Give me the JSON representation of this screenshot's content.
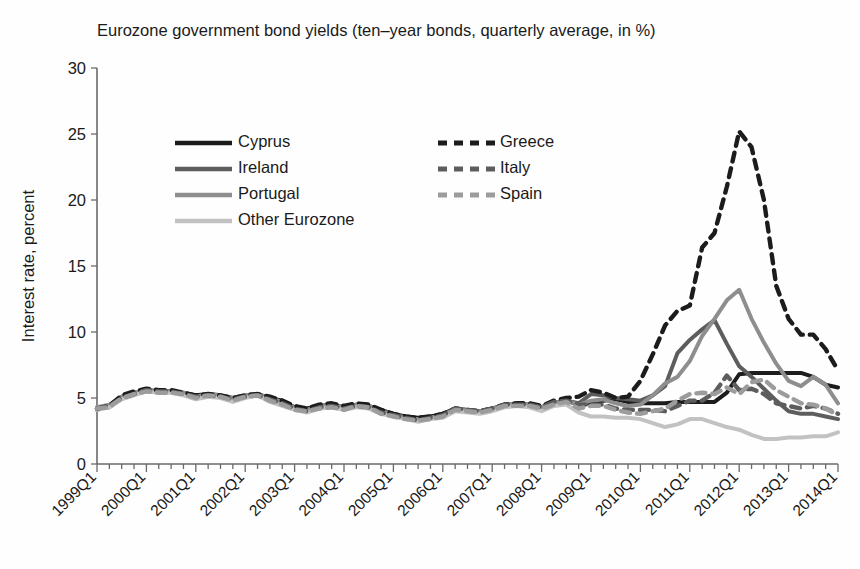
{
  "chart_data": {
    "type": "line",
    "title": "Eurozone government bond yields (ten–year bonds, quarterly average, in %)",
    "xlabel": "",
    "ylabel": "Interest rate, percent",
    "ylim": [
      0,
      30
    ],
    "yticks": [
      0,
      5,
      10,
      15,
      20,
      25,
      30
    ],
    "grid": false,
    "legend_position": "upper-left-inside",
    "x_tick_labels": [
      "1999Q1",
      "2000Q1",
      "2001Q1",
      "2002Q1",
      "2003Q1",
      "2004Q1",
      "2005Q1",
      "2006Q1",
      "2007Q1",
      "2008Q1",
      "2009Q1",
      "2010Q1",
      "2011Q1",
      "2012Q1",
      "2013Q1",
      "2014Q1"
    ],
    "x_minor_ticks_per_label": 4,
    "x": [
      "1999Q1",
      "1999Q2",
      "1999Q3",
      "1999Q4",
      "2000Q1",
      "2000Q2",
      "2000Q3",
      "2000Q4",
      "2001Q1",
      "2001Q2",
      "2001Q3",
      "2001Q4",
      "2002Q1",
      "2002Q2",
      "2002Q3",
      "2002Q4",
      "2003Q1",
      "2003Q2",
      "2003Q3",
      "2003Q4",
      "2004Q1",
      "2004Q2",
      "2004Q3",
      "2004Q4",
      "2005Q1",
      "2005Q2",
      "2005Q3",
      "2005Q4",
      "2006Q1",
      "2006Q2",
      "2006Q3",
      "2006Q4",
      "2007Q1",
      "2007Q2",
      "2007Q3",
      "2007Q4",
      "2008Q1",
      "2008Q2",
      "2008Q3",
      "2008Q4",
      "2009Q1",
      "2009Q2",
      "2009Q3",
      "2009Q4",
      "2010Q1",
      "2010Q2",
      "2010Q3",
      "2010Q4",
      "2011Q1",
      "2011Q2",
      "2011Q3",
      "2011Q4",
      "2012Q1",
      "2012Q2",
      "2012Q3",
      "2012Q4",
      "2013Q1",
      "2013Q2",
      "2013Q3",
      "2013Q4",
      "2014Q1"
    ],
    "series": [
      {
        "name": "Cyprus",
        "style": "solid",
        "color": "#1c1c1c",
        "values": [
          4.2,
          4.3,
          5.0,
          5.3,
          5.6,
          5.5,
          5.5,
          5.4,
          5.2,
          5.3,
          5.2,
          5.0,
          5.2,
          5.3,
          5.0,
          4.8,
          4.3,
          4.2,
          4.4,
          4.5,
          4.3,
          4.5,
          4.4,
          4.1,
          3.8,
          3.6,
          3.5,
          3.6,
          3.8,
          4.2,
          4.1,
          4.0,
          4.2,
          4.5,
          4.5,
          4.5,
          4.3,
          4.6,
          4.8,
          4.5,
          4.6,
          4.8,
          4.9,
          4.7,
          4.6,
          4.6,
          4.6,
          4.7,
          4.7,
          4.7,
          4.7,
          5.4,
          6.8,
          6.9,
          6.9,
          6.9,
          6.9,
          6.9,
          6.6,
          6.0,
          5.8
        ]
      },
      {
        "name": "Ireland",
        "style": "solid",
        "color": "#5d5d5d",
        "values": [
          4.1,
          4.4,
          5.1,
          5.4,
          5.6,
          5.5,
          5.5,
          5.3,
          5.0,
          5.2,
          5.1,
          4.9,
          5.1,
          5.3,
          4.9,
          4.5,
          4.2,
          4.0,
          4.3,
          4.4,
          4.2,
          4.4,
          4.3,
          3.9,
          3.7,
          3.4,
          3.3,
          3.5,
          3.6,
          4.1,
          4.0,
          3.9,
          4.1,
          4.4,
          4.5,
          4.4,
          4.2,
          4.6,
          4.8,
          4.6,
          5.3,
          5.2,
          5.0,
          4.9,
          4.8,
          5.2,
          5.9,
          8.4,
          9.4,
          10.2,
          10.9,
          9.1,
          7.4,
          6.6,
          5.7,
          4.8,
          4.0,
          3.8,
          3.8,
          3.6,
          3.4
        ]
      },
      {
        "name": "Portugal",
        "style": "solid",
        "color": "#8e8e8e",
        "values": [
          4.3,
          4.5,
          5.1,
          5.4,
          5.6,
          5.5,
          5.5,
          5.4,
          5.1,
          5.3,
          5.2,
          5.0,
          5.2,
          5.3,
          5.0,
          4.7,
          4.3,
          4.1,
          4.4,
          4.5,
          4.3,
          4.5,
          4.4,
          4.0,
          3.8,
          3.5,
          3.4,
          3.5,
          3.7,
          4.2,
          4.1,
          4.0,
          4.2,
          4.5,
          4.5,
          4.5,
          4.3,
          4.6,
          4.8,
          4.5,
          4.8,
          4.9,
          4.6,
          4.4,
          4.5,
          5.2,
          6.1,
          6.6,
          7.8,
          9.7,
          11.0,
          12.4,
          13.2,
          11.0,
          9.2,
          7.6,
          6.3,
          5.9,
          6.6,
          6.0,
          4.6
        ]
      },
      {
        "name": "Other Eurozone",
        "style": "solid",
        "color": "#c2c2c2",
        "values": [
          4.1,
          4.3,
          4.9,
          5.2,
          5.5,
          5.4,
          5.4,
          5.2,
          4.9,
          5.1,
          5.0,
          4.7,
          5.0,
          5.2,
          4.7,
          4.4,
          4.1,
          3.9,
          4.2,
          4.3,
          4.1,
          4.3,
          4.2,
          3.8,
          3.6,
          3.4,
          3.2,
          3.4,
          3.5,
          4.0,
          3.9,
          3.8,
          4.0,
          4.3,
          4.4,
          4.3,
          4.0,
          4.4,
          4.5,
          3.9,
          3.6,
          3.6,
          3.5,
          3.5,
          3.4,
          3.1,
          2.8,
          3.0,
          3.4,
          3.4,
          3.1,
          2.8,
          2.6,
          2.2,
          1.9,
          1.9,
          2.0,
          2.0,
          2.1,
          2.1,
          2.4
        ]
      },
      {
        "name": "Greece",
        "style": "dashed",
        "color": "#1c1c1c",
        "values": [
          4.2,
          4.4,
          5.2,
          5.5,
          5.7,
          5.6,
          5.6,
          5.4,
          5.2,
          5.3,
          5.2,
          5.0,
          5.2,
          5.3,
          5.1,
          4.8,
          4.4,
          4.2,
          4.5,
          4.6,
          4.4,
          4.6,
          4.5,
          4.1,
          3.8,
          3.6,
          3.5,
          3.6,
          3.8,
          4.2,
          4.1,
          4.0,
          4.2,
          4.5,
          4.6,
          4.6,
          4.4,
          4.8,
          5.0,
          5.1,
          5.6,
          5.4,
          5.0,
          5.1,
          6.3,
          8.3,
          10.5,
          11.6,
          12.0,
          16.4,
          17.5,
          21.0,
          25.2,
          24.0,
          20.0,
          13.5,
          11.0,
          9.8,
          9.8,
          8.7,
          7.1
        ]
      },
      {
        "name": "Italy",
        "style": "dashed",
        "color": "#5d5d5d",
        "values": [
          4.2,
          4.4,
          5.0,
          5.3,
          5.6,
          5.5,
          5.5,
          5.3,
          5.1,
          5.2,
          5.1,
          4.9,
          5.1,
          5.2,
          4.9,
          4.6,
          4.2,
          4.0,
          4.3,
          4.4,
          4.2,
          4.4,
          4.3,
          3.9,
          3.7,
          3.5,
          3.3,
          3.5,
          3.7,
          4.2,
          4.1,
          4.0,
          4.2,
          4.5,
          4.5,
          4.5,
          4.3,
          4.7,
          4.8,
          4.5,
          4.5,
          4.5,
          4.2,
          4.1,
          4.1,
          4.1,
          4.0,
          4.4,
          4.8,
          4.8,
          5.4,
          6.7,
          5.6,
          5.7,
          5.3,
          4.6,
          4.4,
          4.2,
          4.4,
          4.2,
          3.8
        ]
      },
      {
        "name": "Spain",
        "style": "dashed",
        "color": "#9c9c9c",
        "values": [
          4.2,
          4.3,
          5.0,
          5.3,
          5.5,
          5.4,
          5.4,
          5.3,
          5.0,
          5.2,
          5.1,
          4.8,
          5.1,
          5.2,
          4.8,
          4.5,
          4.1,
          4.0,
          4.2,
          4.3,
          4.1,
          4.4,
          4.3,
          3.8,
          3.6,
          3.4,
          3.3,
          3.4,
          3.6,
          4.1,
          4.0,
          3.9,
          4.1,
          4.4,
          4.4,
          4.4,
          4.2,
          4.5,
          4.7,
          4.2,
          4.4,
          4.4,
          4.1,
          3.9,
          3.8,
          4.0,
          4.2,
          4.8,
          5.3,
          5.4,
          5.3,
          5.8,
          5.3,
          6.2,
          6.4,
          5.6,
          5.1,
          4.6,
          4.5,
          4.2,
          3.7
        ]
      }
    ]
  },
  "legend": {
    "items": [
      {
        "label": "Cyprus"
      },
      {
        "label": "Ireland"
      },
      {
        "label": "Portugal"
      },
      {
        "label": "Other Eurozone"
      },
      {
        "label": "Greece"
      },
      {
        "label": "Italy"
      },
      {
        "label": "Spain"
      }
    ]
  }
}
